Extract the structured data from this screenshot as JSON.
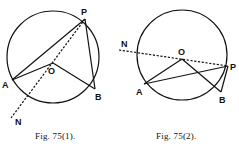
{
  "figures": [
    {
      "id": "fig1",
      "caption": "Fig. 75(1).",
      "points": {
        "P": "P",
        "A": "A",
        "O": "O",
        "B": "B",
        "N": "N"
      },
      "segments": [
        "PA",
        "AO",
        "OB",
        "PB",
        "PN (dashed, through O)"
      ]
    },
    {
      "id": "fig2",
      "caption": "Fig. 75(2).",
      "points": {
        "P": "P",
        "A": "A",
        "O": "O",
        "B": "B",
        "N": "N"
      },
      "segments": [
        "AO",
        "OB",
        "AP",
        "PB",
        "NP (dashed, through O)"
      ]
    }
  ]
}
